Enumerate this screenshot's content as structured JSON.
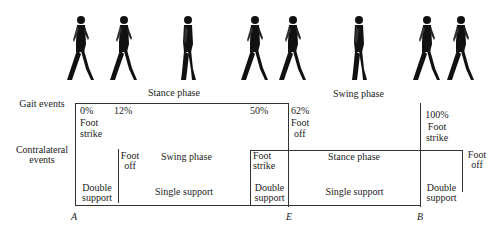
{
  "figures": {
    "count": 8,
    "icon": "walking-person-silhouette-icon",
    "positions_x": [
      64,
      107,
      172,
      238,
      276,
      343,
      410,
      444
    ]
  },
  "phases": {
    "stance": "Stance phase",
    "swing": "Swing phase"
  },
  "row_labels": {
    "gait_events": "Gait events",
    "contralateral_line1": "Contralateral",
    "contralateral_line2": "events"
  },
  "gait_events": [
    {
      "percent": "0%",
      "line1": "Foot",
      "line2": "strike"
    },
    {
      "percent": "12%"
    },
    {
      "percent": "50%"
    },
    {
      "percent": "62%",
      "line1": "Foot",
      "line2": "off"
    },
    {
      "percent": "100%",
      "line1": "Foot",
      "line2": "strike"
    }
  ],
  "contralateral_events": [
    {
      "line1": "Foot",
      "line2": "off",
      "phase": "Swing phase"
    },
    {
      "line1": "Foot",
      "line2": "strike"
    },
    {
      "phase": "Stance phase"
    },
    {
      "line1": "Foot",
      "line2": "off"
    }
  ],
  "support": [
    {
      "line1": "Double",
      "line2": "support"
    },
    {
      "label": "Single support"
    },
    {
      "line1": "Double",
      "line2": "support"
    },
    {
      "label": "Single support"
    },
    {
      "line1": "Double",
      "line2": "support"
    }
  ],
  "axis_points": [
    "A",
    "E",
    "B"
  ]
}
